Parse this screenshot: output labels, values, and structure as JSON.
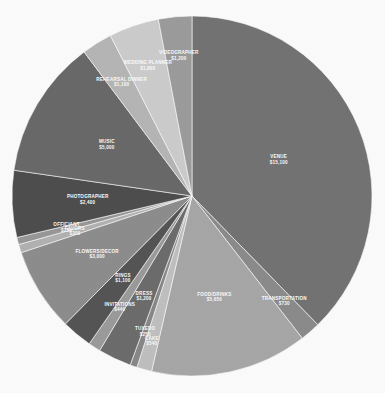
{
  "chart_data": {
    "type": "pie",
    "title": "",
    "subtitle": "",
    "xlabel": "",
    "ylabel": "",
    "legend_position": "none",
    "grid": false,
    "label_format": "NAME on first line, $VALUE on second line",
    "currency": "$",
    "total": 39000,
    "categories": [
      "VENUE",
      "TRANSPORTATION",
      "FOOD/DRINKS",
      "CAKE",
      "TUXEDO",
      "DRESS",
      "INVITATIONS",
      "RINGS",
      "FLOWERS/DECOR",
      "FAVORS",
      "OFFICIANT",
      "PHOTOGRAPHER",
      "MUSIC",
      "REHEARSAL DINNER",
      "WEDDING PLANNER",
      "VIDEOGRAPHER"
    ],
    "values": [
      15100,
      730,
      5650,
      540,
      250,
      1200,
      440,
      1100,
      3000,
      300,
      260,
      2400,
      5000,
      1100,
      1800,
      1200
    ],
    "value_labels": [
      "$15,100",
      "$730",
      "$5,650",
      "$540",
      "$250",
      "$1,200",
      "$440",
      "$1,100",
      "$3,000",
      "$300",
      "$260",
      "$2,400",
      "$5,000",
      "$1,100",
      "$1,800",
      "$1,200"
    ],
    "colors": [
      "#757575",
      "#8d8d8d",
      "#a9a9a9",
      "#c2c2c2",
      "#8a8a8a",
      "#6e6e6e",
      "#9d9d9d",
      "#565656",
      "#8f8f8f",
      "#b4b4b4",
      "#9a9a9a",
      "#4f4f4f",
      "#6b6b6b",
      "#b8b8b8",
      "#cfcfcf",
      "#9e9e9e"
    ],
    "start_angle_deg": -90,
    "direction": "clockwise",
    "center": {
      "x": 192,
      "y": 196
    },
    "radius": 180,
    "background_color": "#ffffff",
    "label_color": "#ffffff"
  }
}
